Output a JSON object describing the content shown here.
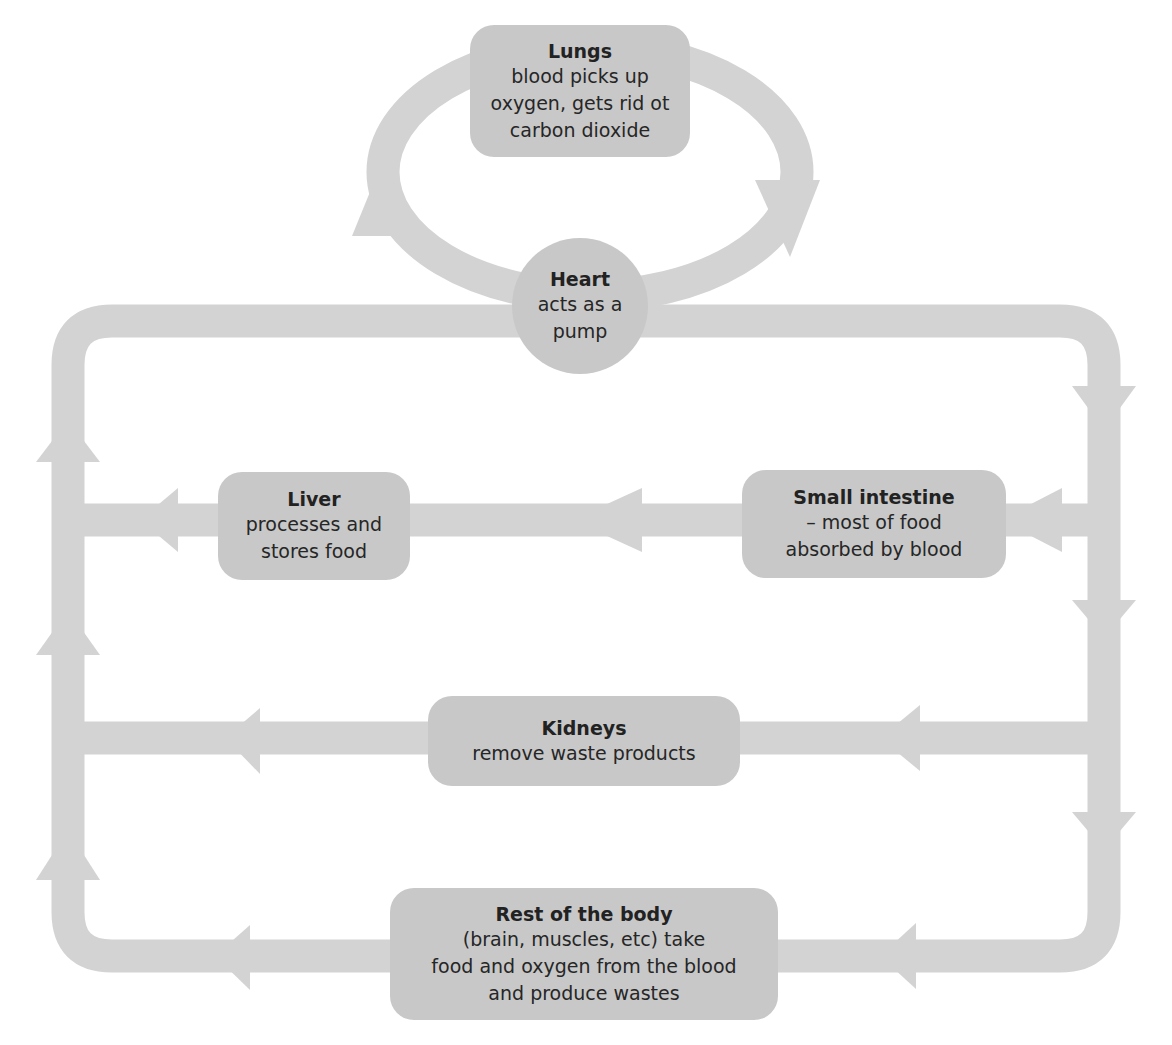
{
  "diagram": {
    "colors": {
      "pipe": "#d3d3d3",
      "node": "#c8c8c8",
      "text": "#222222",
      "background": "#ffffff"
    },
    "nodes": {
      "lungs": {
        "title": "Lungs",
        "desc": "blood picks up\noxygen, gets rid ot\ncarbon dioxide"
      },
      "heart": {
        "title": "Heart",
        "desc": "acts as a\npump"
      },
      "liver": {
        "title": "Liver",
        "desc": "processes and\nstores food"
      },
      "small_intestine": {
        "title": "Small intestine",
        "desc": "– most of food\nabsorbed by blood"
      },
      "kidneys": {
        "title": "Kidneys",
        "desc": "remove waste products"
      },
      "rest_of_body": {
        "title": "Rest of the body",
        "desc": "(brain, muscles, etc) take\nfood and oxygen from the blood\nand produce wastes"
      }
    },
    "flows": [
      {
        "from": "heart",
        "to": "lungs",
        "direction": "up-left loop"
      },
      {
        "from": "lungs",
        "to": "heart",
        "direction": "down-right loop"
      },
      {
        "from": "heart",
        "to": "right-vessel",
        "direction": "right then down"
      },
      {
        "from": "right-vessel",
        "to": "small_intestine",
        "direction": "left"
      },
      {
        "from": "small_intestine",
        "to": "liver",
        "direction": "left"
      },
      {
        "from": "liver",
        "to": "left-vessel",
        "direction": "left"
      },
      {
        "from": "right-vessel",
        "to": "kidneys",
        "direction": "left"
      },
      {
        "from": "kidneys",
        "to": "left-vessel",
        "direction": "left"
      },
      {
        "from": "right-vessel",
        "to": "rest_of_body",
        "direction": "left"
      },
      {
        "from": "rest_of_body",
        "to": "left-vessel",
        "direction": "left"
      },
      {
        "from": "left-vessel",
        "to": "heart",
        "direction": "up then right"
      }
    ]
  }
}
